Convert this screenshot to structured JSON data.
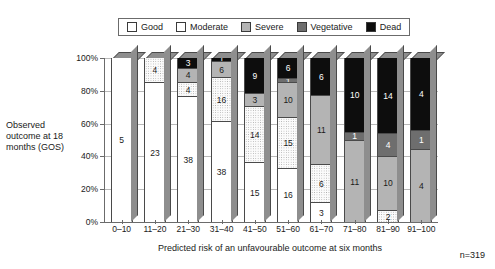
{
  "legend": {
    "items": [
      {
        "label": "Good",
        "key": "good",
        "color": "#ffffff"
      },
      {
        "label": "Moderate",
        "key": "moderate",
        "color": "#fbfbfb"
      },
      {
        "label": "Severe",
        "key": "severe",
        "color": "#b4b4b4"
      },
      {
        "label": "Vegetative",
        "key": "vegetative",
        "color": "#6e6e6e"
      },
      {
        "label": "Dead",
        "key": "dead",
        "color": "#0d0d0d"
      }
    ]
  },
  "axes": {
    "y_title": "Observed outcome at 18 months (GOS)",
    "x_title": "Predicted risk of an unfavourable outcome at six months",
    "y_ticks": [
      "0%",
      "20%",
      "40%",
      "60%",
      "80%",
      "100%"
    ]
  },
  "annotation": {
    "n_note": "n=319"
  },
  "chart_data": {
    "type": "bar",
    "title": "",
    "subtitle": "",
    "stacked": true,
    "stack_mode": "percent",
    "xlabel": "Predicted risk of an unfavourable outcome at six months",
    "ylabel": "Observed outcome at 18 months (GOS)",
    "ylim": [
      0,
      100
    ],
    "yticks": [
      0,
      20,
      40,
      60,
      80,
      100
    ],
    "ytick_labels": [
      "0%",
      "20%",
      "40%",
      "60%",
      "80%",
      "100%"
    ],
    "grid": true,
    "legend_position": "top",
    "annotations": [
      "n=319"
    ],
    "total_n": 319,
    "categories": [
      "0–10",
      "11–20",
      "21–30",
      "31–40",
      "41–50",
      "51–60",
      "61–70",
      "71–80",
      "81–90",
      "91–100"
    ],
    "series": [
      {
        "name": "Good",
        "color": "#ffffff",
        "values": [
          5,
          23,
          38,
          38,
          15,
          16,
          3,
          0,
          0,
          0
        ]
      },
      {
        "name": "Moderate",
        "color": "#fbfbfb",
        "values": [
          0,
          4,
          4,
          16,
          14,
          15,
          6,
          0,
          2,
          0
        ]
      },
      {
        "name": "Severe",
        "color": "#b4b4b4",
        "values": [
          0,
          0,
          4,
          6,
          3,
          10,
          11,
          11,
          10,
          4
        ]
      },
      {
        "name": "Vegetative",
        "color": "#6e6e6e",
        "values": [
          0,
          0,
          0,
          0,
          0,
          1,
          0,
          1,
          4,
          1
        ]
      },
      {
        "name": "Dead",
        "color": "#0d0d0d",
        "values": [
          0,
          0,
          3,
          1,
          9,
          6,
          6,
          10,
          14,
          4
        ]
      }
    ]
  }
}
